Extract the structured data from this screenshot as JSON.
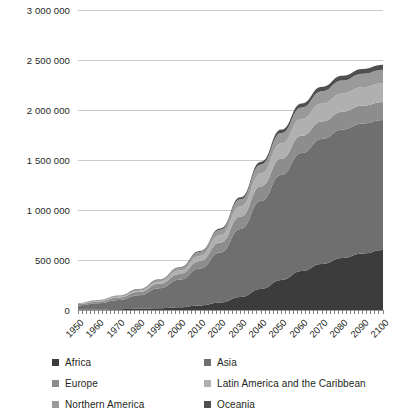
{
  "chart_data": {
    "type": "area",
    "stacked": true,
    "title": "",
    "subtitle": "",
    "xlabel": "",
    "ylabel": "",
    "units_note": "",
    "grid": true,
    "legend_position": "bottom",
    "xlim": [
      1950,
      2100
    ],
    "ylim": [
      0,
      3000000
    ],
    "ytick_values": [
      0,
      500000,
      1000000,
      1500000,
      2000000,
      2500000,
      3000000
    ],
    "ytick_labels": [
      "0",
      "500 000",
      "1 000 000",
      "1 500 000",
      "2 000 000",
      "2 500 000",
      "3 000 000"
    ],
    "categories": [
      1950,
      1960,
      1970,
      1980,
      1990,
      2000,
      2010,
      2020,
      2030,
      2040,
      2050,
      2060,
      2070,
      2080,
      2090,
      2100
    ],
    "xtick_labels": [
      "1950",
      "1960",
      "1970",
      "1980",
      "1990",
      "2000",
      "2010",
      "2020",
      "2030",
      "2040",
      "2050",
      "2060",
      "2070",
      "2080",
      "2090",
      "2100"
    ],
    "series": [
      {
        "name": "Africa",
        "color": "#3c3c3c",
        "values": [
          4000,
          6000,
          8000,
          12000,
          18000,
          28000,
          45000,
          75000,
          130000,
          210000,
          300000,
          390000,
          460000,
          520000,
          565000,
          600000
        ]
      },
      {
        "name": "Asia",
        "color": "#6f6f6f",
        "values": [
          42000,
          62000,
          92000,
          135000,
          200000,
          275000,
          370000,
          500000,
          680000,
          880000,
          1050000,
          1180000,
          1250000,
          1285000,
          1300000,
          1300000
        ]
      },
      {
        "name": "Europe",
        "color": "#8d8d8d",
        "values": [
          14000,
          18000,
          24000,
          32000,
          44000,
          58000,
          76000,
          100000,
          125000,
          148000,
          163000,
          172000,
          176000,
          178000,
          179000,
          180000
        ]
      },
      {
        "name": "Latin America and the Caribbean",
        "color": "#b0b0b0",
        "values": [
          3000,
          5000,
          8000,
          13000,
          21000,
          33000,
          50000,
          72000,
          100000,
          128000,
          152000,
          168000,
          178000,
          183000,
          186000,
          188000
        ]
      },
      {
        "name": "Northern America",
        "color": "#9a9a9a",
        "values": [
          5000,
          7000,
          10000,
          14000,
          20000,
          28000,
          40000,
          55000,
          72000,
          90000,
          105000,
          116000,
          124000,
          129000,
          132000,
          134000
        ]
      },
      {
        "name": "Oceania",
        "color": "#4f4f4f",
        "values": [
          1000,
          1500,
          2200,
          3200,
          4600,
          6500,
          9500,
          14000,
          20000,
          27000,
          34000,
          40000,
          44000,
          47000,
          49000,
          50000
        ]
      }
    ]
  },
  "legend": {
    "items": [
      {
        "label": "Africa",
        "color": "#3c3c3c"
      },
      {
        "label": "Asia",
        "color": "#6f6f6f"
      },
      {
        "label": "Europe",
        "color": "#8d8d8d"
      },
      {
        "label": "Latin America and the Caribbean",
        "color": "#b0b0b0"
      },
      {
        "label": "Northern America",
        "color": "#9a9a9a"
      },
      {
        "label": "Oceania",
        "color": "#4f4f4f"
      }
    ]
  },
  "axes": {
    "grid_color": "#c9c9c9",
    "tick_color": "#808080",
    "text_color": "#231f20"
  }
}
